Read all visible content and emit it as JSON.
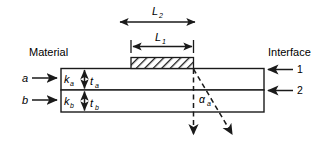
{
  "figure": {
    "type": "technical-cross-section-diagram",
    "labels": {
      "material_heading": "Material",
      "interface_heading": "Interface",
      "layer_a": "a",
      "layer_b": "b",
      "conductivity_a": "k",
      "conductivity_a_sub": "a",
      "conductivity_b": "k",
      "conductivity_b_sub": "b",
      "thickness_a": "t",
      "thickness_a_sub": "a",
      "thickness_b": "t",
      "thickness_b_sub": "b",
      "length_1": "L",
      "length_1_sub": "1",
      "length_2": "L",
      "length_2_sub": "2",
      "angle_a": "α",
      "angle_a_sub": "a",
      "interface_1": "1",
      "interface_2": "2"
    },
    "colors": {
      "line": "#1a1a1a",
      "spread_region": "#a8a8a8",
      "background": "#ffffff",
      "hatch": "#1a1a1a"
    },
    "elements": {
      "source_block": "hatched-rectangle",
      "spread_region": "gray-trapezoid",
      "flow_arrows": "dashed-arrows",
      "dimension_arrows": "double-headed"
    }
  }
}
